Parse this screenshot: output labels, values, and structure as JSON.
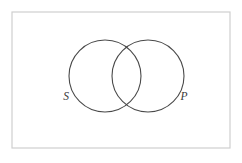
{
  "figure": {
    "type": "venn-diagram",
    "title": "",
    "background_color": "#ffffff",
    "frame": {
      "name": "diagram-border",
      "x": 12,
      "y": 12,
      "width": 218,
      "height": 136,
      "stroke_color": "#cfcfcf",
      "stroke_width": 1.2,
      "fill": "none"
    },
    "circles": [
      {
        "id": "subject",
        "label": "S",
        "cx": 105,
        "cy": 76,
        "r": 36,
        "stroke_color": "#4a4a4a",
        "stroke_width": 1.1,
        "fill": "none"
      },
      {
        "id": "predicate",
        "label": "P",
        "cx": 148,
        "cy": 76,
        "r": 36,
        "stroke_color": "#4a4a4a",
        "stroke_width": 1.1,
        "fill": "none"
      }
    ],
    "labels": [
      {
        "id": "label-s",
        "text": "S",
        "x": 66,
        "y": 97,
        "color": "#3a3a3a",
        "style": "italic"
      },
      {
        "id": "label-p",
        "text": "P",
        "x": 184,
        "y": 97,
        "color": "#3a3a3a",
        "style": "italic"
      }
    ]
  }
}
